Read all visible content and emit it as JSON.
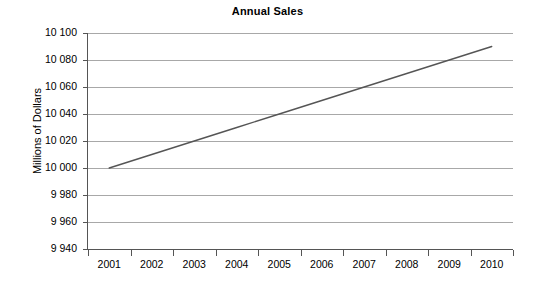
{
  "chart_data": {
    "type": "line",
    "title": "Annual Sales",
    "xlabel": "",
    "ylabel": "Millions of Dollars",
    "categories": [
      "2001",
      "2002",
      "2003",
      "2004",
      "2005",
      "2006",
      "2007",
      "2008",
      "2009",
      "2010"
    ],
    "series": [
      {
        "name": "Annual Sales",
        "values": [
          10000,
          10010,
          10020,
          10030,
          10040,
          10050,
          10060,
          10070,
          10080,
          10090
        ],
        "color": "#555555"
      }
    ],
    "ylim": [
      9940,
      10100
    ],
    "ytick_step": 20,
    "ytick_labels": [
      "10 100",
      "10 080",
      "10 060",
      "10 040",
      "10 020",
      "10 000",
      "9 980",
      "9 960",
      "9 940"
    ],
    "ytick_values": [
      10100,
      10080,
      10060,
      10040,
      10020,
      10000,
      9980,
      9960,
      9940
    ],
    "grid": true,
    "grid_color": "#a8a8a8",
    "axis_color": "#555555",
    "legend": false,
    "legend_position": "none",
    "background": "#ffffff"
  },
  "chart": {
    "title": "Annual Sales",
    "y_axis_title": "Millions of Dollars"
  }
}
